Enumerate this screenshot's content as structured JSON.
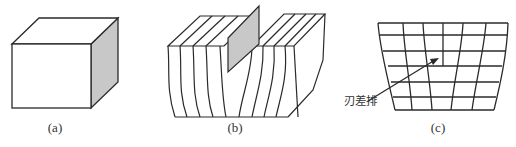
{
  "figure": {
    "panels": [
      {
        "id": "a",
        "caption": "(a)",
        "description": "perfect crystal cube"
      },
      {
        "id": "b",
        "caption": "(b)",
        "description": "extra half-plane inserted into crystal"
      },
      {
        "id": "c",
        "caption": "(c)",
        "description": "lattice cross-section with edge dislocation",
        "annotation": "刃差排"
      }
    ],
    "colors": {
      "stroke": "#2a2a2a",
      "shade": "#c8c8c8",
      "background": "#ffffff"
    }
  }
}
